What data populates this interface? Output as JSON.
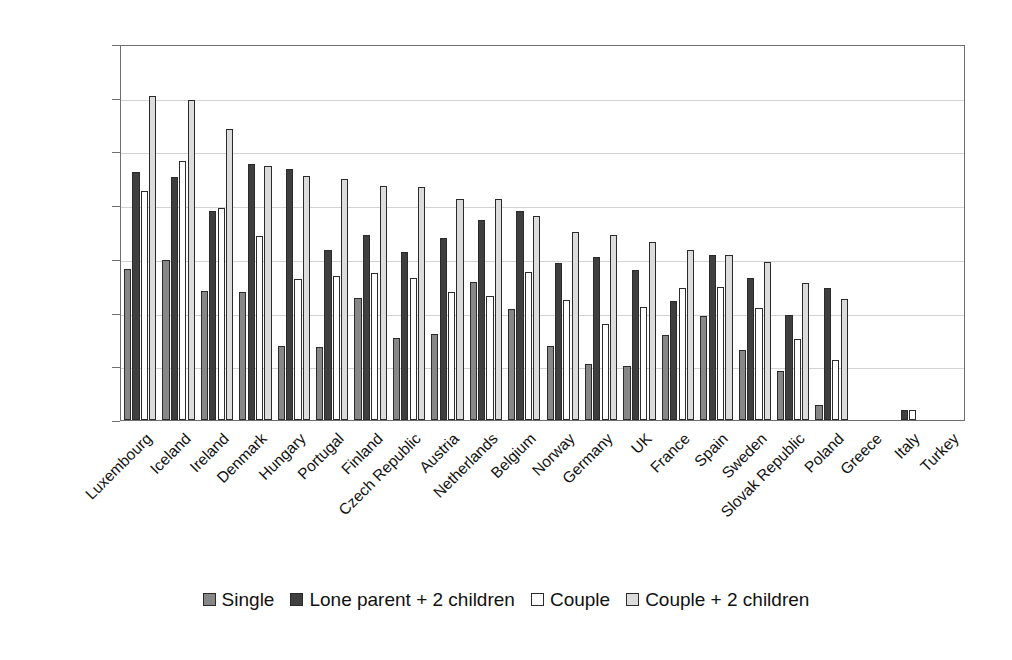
{
  "chart_data": {
    "type": "bar",
    "title": "",
    "subtitle": "",
    "xlabel": "",
    "ylabel": "",
    "ylim": [
      0,
      70
    ],
    "yticks": [
      0,
      10,
      20,
      30,
      40,
      50,
      60,
      70
    ],
    "ytick_labels": [
      "0",
      "10",
      "20",
      "30",
      "40",
      "50",
      "60",
      "70"
    ],
    "grid": true,
    "grid_axis": "y",
    "legend_position": "bottom",
    "orientation": "vertical",
    "categories": [
      "Luxembourg",
      "Iceland",
      "Ireland",
      "Denmark",
      "Hungary",
      "Portugal",
      "Finland",
      "Czech Republic",
      "Austria",
      "Netherlands",
      "Belgium",
      "Norway",
      "Germany",
      "UK",
      "France",
      "Spain",
      "Sweden",
      "Slovak Republic",
      "Poland",
      "Greece",
      "Italy",
      "Turkey"
    ],
    "series": [
      {
        "name": "Single",
        "color": "#878787",
        "values": [
          28.2,
          29.8,
          24.0,
          23.9,
          13.8,
          13.6,
          22.7,
          15.3,
          16.0,
          25.7,
          20.6,
          13.8,
          10.4,
          10.1,
          15.8,
          19.4,
          13.0,
          9.1,
          2.8,
          0.0,
          0.0,
          0.0
        ]
      },
      {
        "name": "Lone parent + 2 children",
        "color": "#3f3f3f",
        "values": [
          46.1,
          45.2,
          38.9,
          47.6,
          46.8,
          31.7,
          34.4,
          31.2,
          33.8,
          37.2,
          39.0,
          29.2,
          30.4,
          27.9,
          22.1,
          30.7,
          26.5,
          19.5,
          24.6,
          0.0,
          1.9,
          0.0
        ]
      },
      {
        "name": "Couple",
        "color": "#ffffff",
        "values": [
          42.7,
          48.3,
          39.5,
          34.2,
          26.2,
          26.8,
          27.3,
          26.5,
          23.9,
          23.0,
          27.5,
          22.4,
          17.9,
          21.0,
          24.6,
          24.7,
          20.9,
          15.0,
          11.2,
          0.0,
          1.8,
          0.0
        ]
      },
      {
        "name": "Couple + 2 children",
        "color": "#dcdcdc",
        "values": [
          60.3,
          59.6,
          54.2,
          47.2,
          45.4,
          44.9,
          43.6,
          43.3,
          41.1,
          41.2,
          37.9,
          35.0,
          34.4,
          33.2,
          31.6,
          30.7,
          29.5,
          25.6,
          22.6,
          0.0,
          0.0,
          0.0
        ]
      }
    ]
  },
  "legend": {
    "items": [
      {
        "label": "Single",
        "swatch": "s0"
      },
      {
        "label": "Lone parent + 2 children",
        "swatch": "s1"
      },
      {
        "label": "Couple",
        "swatch": "s2"
      },
      {
        "label": "Couple + 2 children",
        "swatch": "s3"
      }
    ]
  }
}
